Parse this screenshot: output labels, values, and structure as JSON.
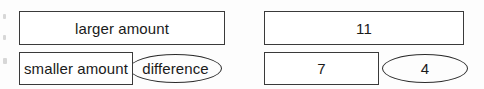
{
  "diagram": {
    "type": "bar-model",
    "models": [
      {
        "name": "worded-model",
        "total": {
          "label": "larger amount",
          "shape": "rectangle"
        },
        "part": {
          "label": "smaller amount",
          "shape": "rectangle"
        },
        "remainder": {
          "label": "difference",
          "shape": "ellipse"
        }
      },
      {
        "name": "numeric-model",
        "total": {
          "label": "11",
          "shape": "rectangle"
        },
        "part": {
          "label": "7",
          "shape": "rectangle"
        },
        "remainder": {
          "label": "4",
          "shape": "ellipse"
        }
      }
    ]
  },
  "style": {
    "stroke_color": "#3a3a3a",
    "ellipse_stroke_color": "#2b2b2b",
    "fill_color": "#ffffff",
    "text_color": "#1a1a1a",
    "background_color": "#fdfdfd"
  }
}
